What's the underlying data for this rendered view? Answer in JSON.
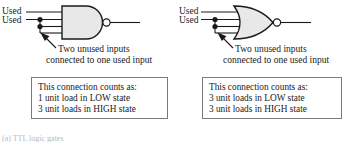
{
  "figure": {
    "caption": "(a) TTL logic gates"
  },
  "panels": [
    {
      "id": "nand",
      "gate_type": "NAND",
      "inputs": [
        {
          "label": "Used"
        },
        {
          "label": "Used"
        }
      ],
      "callout": {
        "line1": "Two unused inputs",
        "line2": "connected to one used input"
      },
      "loadbox": {
        "line1": "This connection counts as:",
        "line2": "1 unit load in LOW state",
        "line3": "3 unit loads in HIGH state"
      }
    },
    {
      "id": "nor",
      "gate_type": "NOR",
      "inputs": [
        {
          "label": "Used"
        },
        {
          "label": "Used"
        }
      ],
      "callout": {
        "line1": "Two unused inputs",
        "line2": "connected to one used input"
      },
      "loadbox": {
        "line1": "This connection counts as:",
        "line2": "3 unit loads in LOW state",
        "line3": "3 unit loads in HIGH state"
      }
    }
  ],
  "colors": {
    "ink": "#1a1a1a",
    "box_border": "#7a7a7a",
    "gate_fill": "#e8e8e8",
    "page": "#ffffff"
  }
}
